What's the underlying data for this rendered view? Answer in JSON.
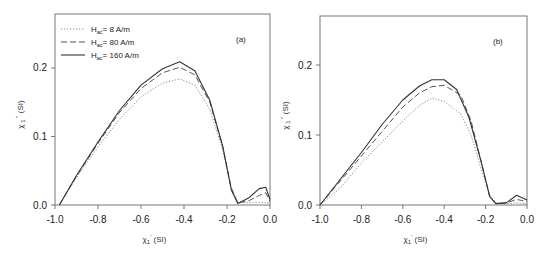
{
  "chart_data": [
    {
      "type": "line",
      "panel_label": "(a)",
      "xlabel": "χ1' (SI)",
      "ylabel": "χ1'' (SI)",
      "xlim": [
        -1.0,
        0.0
      ],
      "ylim": [
        0.0,
        0.27
      ],
      "xticks": [
        -1.0,
        -0.8,
        -0.6,
        -0.4,
        -0.2,
        0.0
      ],
      "xtick_labels": [
        "-1.0",
        "-0.8",
        "-0.6",
        "-0.4",
        "-0.2",
        "0.0"
      ],
      "yticks": [
        0.0,
        0.1,
        0.2
      ],
      "ytick_labels": [
        "0.0",
        "0.1",
        "0.2"
      ],
      "grid": false,
      "legend_position": "upper left",
      "series": [
        {
          "name": "Hac = 8 A/m",
          "style": "dotted",
          "x": [
            -0.98,
            -0.9,
            -0.8,
            -0.7,
            -0.6,
            -0.5,
            -0.42,
            -0.35,
            -0.28,
            -0.22,
            -0.18,
            -0.15,
            -0.1,
            -0.05,
            0.0
          ],
          "y": [
            0.0,
            0.04,
            0.085,
            0.125,
            0.158,
            0.178,
            0.184,
            0.175,
            0.14,
            0.08,
            0.025,
            0.004,
            0.003,
            0.004,
            0.003
          ]
        },
        {
          "name": "Hac = 80 A/m",
          "style": "dashed",
          "x": [
            -0.98,
            -0.9,
            -0.8,
            -0.7,
            -0.6,
            -0.5,
            -0.42,
            -0.35,
            -0.28,
            -0.22,
            -0.18,
            -0.15,
            -0.1,
            -0.05,
            -0.02,
            0.0
          ],
          "y": [
            0.0,
            0.042,
            0.09,
            0.135,
            0.17,
            0.193,
            0.201,
            0.19,
            0.15,
            0.085,
            0.025,
            0.003,
            0.006,
            0.014,
            0.018,
            0.005
          ]
        },
        {
          "name": "Hac = 160 A/m",
          "style": "solid",
          "x": [
            -0.98,
            -0.9,
            -0.8,
            -0.7,
            -0.6,
            -0.5,
            -0.42,
            -0.35,
            -0.28,
            -0.22,
            -0.18,
            -0.15,
            -0.1,
            -0.05,
            -0.02,
            0.0
          ],
          "y": [
            0.0,
            0.043,
            0.092,
            0.138,
            0.175,
            0.199,
            0.209,
            0.196,
            0.153,
            0.086,
            0.022,
            0.002,
            0.01,
            0.024,
            0.026,
            0.008
          ]
        }
      ]
    },
    {
      "type": "line",
      "panel_label": "(b)",
      "xlabel": "χ1' (SI)",
      "ylabel": "χ1'' (SI)",
      "xlim": [
        -1.0,
        0.0
      ],
      "ylim": [
        0.0,
        0.27
      ],
      "xticks": [
        -1.0,
        -0.8,
        -0.6,
        -0.4,
        -0.2,
        0.0
      ],
      "xtick_labels": [
        "-1.0",
        "-0.8",
        "-0.6",
        "-0.4",
        "-0.2",
        "0.0"
      ],
      "yticks": [
        0.0,
        0.1,
        0.2
      ],
      "ytick_labels": [
        "0.0",
        "0.1",
        "0.2"
      ],
      "grid": false,
      "series": [
        {
          "name": "Hac = 8 A/m",
          "style": "dotted",
          "x": [
            -1.0,
            -0.9,
            -0.8,
            -0.7,
            -0.6,
            -0.52,
            -0.46,
            -0.4,
            -0.32,
            -0.27,
            -0.22,
            -0.18,
            -0.15,
            -0.1,
            -0.05,
            0.0
          ],
          "y": [
            0.0,
            0.025,
            0.06,
            0.09,
            0.12,
            0.142,
            0.153,
            0.148,
            0.13,
            0.1,
            0.05,
            0.015,
            0.003,
            0.002,
            0.003,
            0.002
          ]
        },
        {
          "name": "Hac = 80 A/m",
          "style": "dashed",
          "x": [
            -1.0,
            -0.9,
            -0.8,
            -0.7,
            -0.6,
            -0.52,
            -0.46,
            -0.4,
            -0.32,
            -0.27,
            -0.22,
            -0.18,
            -0.15,
            -0.1,
            -0.05,
            0.0
          ],
          "y": [
            0.0,
            0.035,
            0.07,
            0.105,
            0.14,
            0.16,
            0.169,
            0.171,
            0.157,
            0.12,
            0.06,
            0.012,
            0.002,
            0.003,
            0.008,
            0.005
          ]
        },
        {
          "name": "Hac = 160 A/m",
          "style": "solid",
          "x": [
            -1.0,
            -0.92,
            -0.88,
            -0.8,
            -0.7,
            -0.6,
            -0.52,
            -0.46,
            -0.4,
            -0.34,
            -0.28,
            -0.22,
            -0.18,
            -0.15,
            -0.1,
            -0.05,
            0.0
          ],
          "y": [
            0.0,
            0.03,
            0.045,
            0.075,
            0.115,
            0.15,
            0.17,
            0.179,
            0.179,
            0.165,
            0.125,
            0.06,
            0.012,
            0.002,
            0.003,
            0.014,
            0.007
          ]
        }
      ]
    }
  ],
  "panels": [
    {
      "label": "(a)",
      "xlabel": "χ1' (SI)",
      "ylabel": "χ1'' (SI)"
    },
    {
      "label": "(b)",
      "xlabel": "χ1' (SI)",
      "ylabel": "χ1'' (SI)"
    }
  ],
  "legend": {
    "items": [
      {
        "label": "Hac= 8 A/m",
        "sym": "H",
        "sub": "ac",
        "rest": "= 8 A/m"
      },
      {
        "label": "Hac= 80 A/m",
        "sym": "H",
        "sub": "ac",
        "rest": "= 80 A/m"
      },
      {
        "label": "Hac= 160 A/m",
        "sym": "H",
        "sub": "ac",
        "rest": "= 160 A/m"
      }
    ]
  },
  "axis_text": {
    "x_main": "χ",
    "x_sub": "1",
    "x_sup": "'",
    "x_unit": " (SI)",
    "y_main": "χ",
    "y_sub": "1",
    "y_sup": "''",
    "y_unit": " (SI)"
  },
  "colors": {
    "solid": "#333333",
    "dashed": "#555555",
    "dotted": "#888888",
    "axis": "#777777"
  }
}
